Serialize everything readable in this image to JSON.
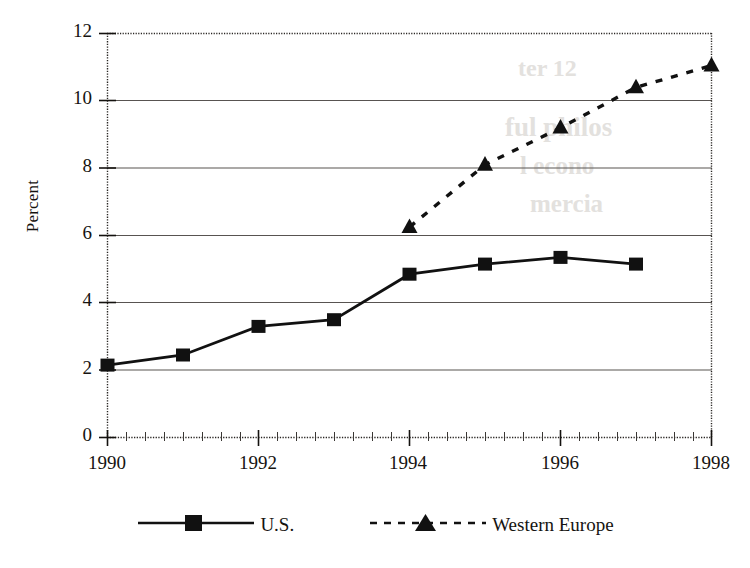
{
  "chart_data": {
    "type": "line",
    "title": "",
    "xlabel": "",
    "ylabel": "Percent",
    "x": [
      1990,
      1991,
      1992,
      1993,
      1994,
      1995,
      1996,
      1997,
      1998
    ],
    "xlim": [
      1990,
      1998
    ],
    "ylim": [
      0,
      12
    ],
    "ytick_step": 2,
    "xtick_step": 2,
    "x_minor_ticks": true,
    "grid": "horizontal",
    "legend_position": "bottom-center",
    "series": [
      {
        "name": "U.S.",
        "marker": "square",
        "line_style": "solid",
        "color": "#111111",
        "points": [
          {
            "x": 1990,
            "y": 2.15
          },
          {
            "x": 1991,
            "y": 2.45
          },
          {
            "x": 1992,
            "y": 3.3
          },
          {
            "x": 1993,
            "y": 3.5
          },
          {
            "x": 1994,
            "y": 4.85
          },
          {
            "x": 1995,
            "y": 5.15
          },
          {
            "x": 1996,
            "y": 5.35
          },
          {
            "x": 1997,
            "y": 5.15
          }
        ]
      },
      {
        "name": "Western Europe",
        "marker": "triangle",
        "line_style": "dashed",
        "color": "#111111",
        "points": [
          {
            "x": 1994,
            "y": 6.25
          },
          {
            "x": 1995,
            "y": 8.1
          },
          {
            "x": 1996,
            "y": 9.2
          },
          {
            "x": 1997,
            "y": 10.4
          },
          {
            "x": 1998,
            "y": 11.05
          }
        ]
      }
    ],
    "y_tick_labels": [
      "12",
      "10",
      "8",
      "6",
      "4",
      "2",
      "0"
    ],
    "x_tick_labels": [
      "1990",
      "1992",
      "1994",
      "1996",
      "1998"
    ]
  },
  "axes": {
    "y_ticks": [
      {
        "label": "12",
        "value": 12
      },
      {
        "label": "10",
        "value": 10
      },
      {
        "label": "8",
        "value": 8
      },
      {
        "label": "6",
        "value": 6
      },
      {
        "label": "4",
        "value": 4
      },
      {
        "label": "2",
        "value": 2
      },
      {
        "label": "0",
        "value": 0
      }
    ],
    "x_ticks": [
      {
        "label": "1990",
        "value": 1990
      },
      {
        "label": "1992",
        "value": 1992
      },
      {
        "label": "1994",
        "value": 1994
      },
      {
        "label": "1996",
        "value": 1996
      },
      {
        "label": "1998",
        "value": 1998
      }
    ]
  },
  "legend": {
    "items": [
      {
        "label": "U.S.",
        "marker": "square",
        "line_style": "solid"
      },
      {
        "label": "Western Europe",
        "marker": "triangle",
        "line_style": "dashed"
      }
    ]
  },
  "colors": {
    "ink": "#111111",
    "gridline": "#585451",
    "background": "#ffffff"
  }
}
